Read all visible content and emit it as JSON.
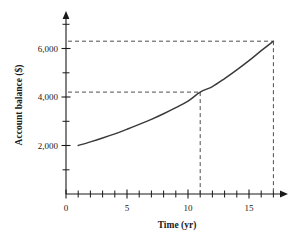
{
  "chart_data": {
    "type": "line",
    "title": "",
    "xlabel": "Time (yr)",
    "ylabel": "Account balance ($)",
    "xlim": [
      0,
      18
    ],
    "ylim": [
      0,
      7000
    ],
    "grid": false,
    "legend": "none",
    "x_ticks_major": [
      0,
      5,
      10,
      15
    ],
    "x_tick_labels": [
      "0",
      "5",
      "10",
      "15"
    ],
    "x_ticks_minor": [
      1,
      2,
      3,
      4,
      6,
      7,
      8,
      9,
      11,
      12,
      13,
      14,
      16,
      17
    ],
    "y_ticks_major": [
      2000,
      4000,
      6000
    ],
    "y_tick_labels": [
      "2,000",
      "4,000",
      "6,000"
    ],
    "y_ticks_minor": [
      1000,
      3000,
      5000,
      7000
    ],
    "series": [
      {
        "name": "Account balance",
        "x": [
          1,
          2,
          3,
          4,
          5,
          6,
          7,
          8,
          9,
          10,
          11,
          12,
          13,
          14,
          15,
          16,
          17
        ],
        "values": [
          2000,
          2150,
          2310,
          2480,
          2670,
          2870,
          3080,
          3310,
          3560,
          3830,
          4200,
          4430,
          4760,
          5120,
          5500,
          5910,
          6300
        ]
      }
    ],
    "annotations": [
      {
        "name": "reference-point-1",
        "x": 11,
        "y": 4200,
        "dashed_horizontal": true,
        "dashed_vertical": true,
        "label": ""
      },
      {
        "name": "reference-point-2",
        "x": 17,
        "y": 6300,
        "dashed_horizontal": true,
        "dashed_vertical": true,
        "label": ""
      }
    ],
    "colors": {
      "curve": "#3a3a3a",
      "axis": "#1a1a1a",
      "dashed": "#4d4d4d",
      "background": "#ffffff"
    }
  }
}
